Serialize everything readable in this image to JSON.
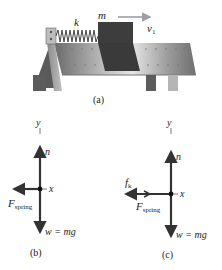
{
  "figure_a": {
    "caption": "(a)",
    "spring_label": "k",
    "mass_label": "m",
    "velocity_label": "v",
    "velocity_subscript": "1"
  },
  "figure_b": {
    "caption": "(b)",
    "axis_y": "y",
    "axis_x": "x",
    "normal_label": "n",
    "spring_force_label": "F",
    "spring_force_subscript": "spring",
    "weight_label": "w = mg"
  },
  "figure_c": {
    "caption": "(c)",
    "axis_y": "y",
    "axis_x": "x",
    "normal_label": "n",
    "friction_label": "f",
    "friction_subscript": "k",
    "spring_force_label": "F",
    "spring_force_subscript": "spring",
    "weight_label": "w = mg"
  },
  "colors": {
    "surface_dark": "#5a5a5a",
    "surface_light": "#d8d8d8",
    "block": "#3a3a3a",
    "velocity_arrow": "#9aa0a6",
    "vector": "#333333"
  }
}
